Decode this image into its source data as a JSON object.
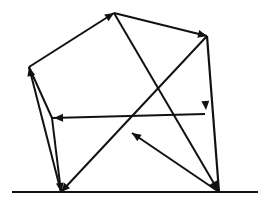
{
  "figure": {
    "type": "diagram",
    "width": 272,
    "height": 212,
    "background_color": "#ffffff",
    "stroke_color": "#111111",
    "ground": {
      "label": "ground-line",
      "x1": 12,
      "y1": 192,
      "x2": 258,
      "y2": 192,
      "stroke_width": 2.2
    },
    "vertices": [
      {
        "id": "apex",
        "label": "apex",
        "x": 114,
        "y": 13
      },
      {
        "id": "top_right",
        "label": "top-right",
        "x": 207,
        "y": 36
      },
      {
        "id": "left",
        "label": "left",
        "x": 29,
        "y": 67
      },
      {
        "id": "mid_left",
        "label": "mid-left",
        "x": 52,
        "y": 118
      },
      {
        "id": "right_mid",
        "label": "right-mid",
        "x": 205,
        "y": 114
      },
      {
        "id": "bottom_left",
        "label": "bottom-left",
        "x": 61,
        "y": 192
      },
      {
        "id": "bottom_right",
        "label": "bottom-right",
        "x": 219,
        "y": 192
      },
      {
        "id": "center_node",
        "label": "center-crossing",
        "x": 132,
        "y": 133
      }
    ],
    "edges": [
      {
        "id": "e1",
        "label": "left-to-apex",
        "from": "left",
        "to": "apex",
        "x1": 29,
        "y1": 67,
        "x2": 114,
        "y2": 13,
        "stroke_width": 2.0,
        "arrow": "end",
        "arrow_x": 114,
        "arrow_y": 13,
        "arrow_size": 9
      },
      {
        "id": "e2",
        "label": "apex-to-top-right",
        "from": "apex",
        "to": "top_right",
        "x1": 114,
        "y1": 13,
        "x2": 207,
        "y2": 36,
        "stroke_width": 2.0,
        "arrow": "end",
        "arrow_x": 207,
        "arrow_y": 36,
        "arrow_size": 9
      },
      {
        "id": "e3",
        "label": "top-right-to-bottom-right",
        "from": "top_right",
        "to": "bottom_right",
        "x1": 207,
        "y1": 36,
        "x2": 219,
        "y2": 192,
        "stroke_width": 2.2,
        "arrow": "mid",
        "arrow_x": 206,
        "arrow_y": 110,
        "arrow_size": 9
      },
      {
        "id": "e4",
        "label": "bottom-left-to-left",
        "from": "bottom_left",
        "to": "left",
        "x1": 61,
        "y1": 192,
        "x2": 29,
        "y2": 67,
        "stroke_width": 2.0,
        "arrow": "end",
        "arrow_x": 29,
        "arrow_y": 67,
        "arrow_size": 9
      },
      {
        "id": "e5",
        "label": "left-to-mid-left",
        "from": "left",
        "to": "mid_left",
        "x1": 29,
        "y1": 67,
        "x2": 52,
        "y2": 118,
        "stroke_width": 2.0,
        "arrow": "none",
        "arrow_x": 0,
        "arrow_y": 0,
        "arrow_size": 0
      },
      {
        "id": "e6",
        "label": "mid-left-to-bottom-left",
        "from": "mid_left",
        "to": "bottom_left",
        "x1": 52,
        "y1": 118,
        "x2": 61,
        "y2": 192,
        "stroke_width": 2.0,
        "arrow": "end",
        "arrow_x": 61,
        "arrow_y": 192,
        "arrow_size": 9
      },
      {
        "id": "e7",
        "label": "right-mid-to-mid-left",
        "from": "right_mid",
        "to": "mid_left",
        "x1": 205,
        "y1": 114,
        "x2": 52,
        "y2": 118,
        "stroke_width": 2.0,
        "arrow": "end",
        "arrow_x": 54,
        "arrow_y": 118,
        "arrow_size": 9
      },
      {
        "id": "e8",
        "label": "bottom-right-to-center",
        "from": "bottom_right",
        "to": "center_node",
        "x1": 219,
        "y1": 192,
        "x2": 132,
        "y2": 133,
        "stroke_width": 2.0,
        "arrow": "end",
        "arrow_x": 132,
        "arrow_y": 133,
        "arrow_size": 9
      },
      {
        "id": "e9",
        "label": "apex-to-bottom-right",
        "from": "apex",
        "to": "bottom_right",
        "x1": 114,
        "y1": 13,
        "x2": 219,
        "y2": 192,
        "stroke_width": 2.0,
        "arrow": "end",
        "arrow_x": 219,
        "arrow_y": 192,
        "arrow_size": 11
      },
      {
        "id": "e10",
        "label": "top-right-to-bottom-left",
        "from": "top_right",
        "to": "bottom_left",
        "x1": 207,
        "y1": 36,
        "x2": 61,
        "y2": 192,
        "stroke_width": 2.0,
        "arrow": "end",
        "arrow_x": 61,
        "arrow_y": 192,
        "arrow_size": 9
      }
    ]
  }
}
